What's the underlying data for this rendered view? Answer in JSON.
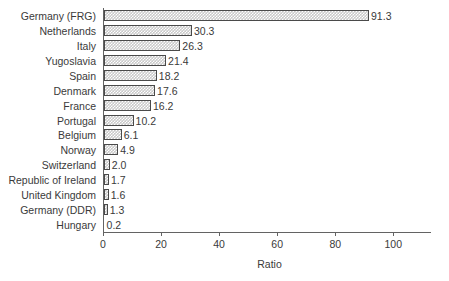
{
  "chart_data": {
    "type": "bar",
    "orientation": "horizontal",
    "title": "",
    "xlabel": "Ratio",
    "ylabel": "",
    "categories": [
      "Germany (FRG)",
      "Netherlands",
      "Italy",
      "Yugoslavia",
      "Spain",
      "Denmark",
      "France",
      "Portugal",
      "Belgium",
      "Norway",
      "Switzerland",
      "Republic of Ireland",
      "United Kingdom",
      "Germany (DDR)",
      "Hungary"
    ],
    "values": [
      91.3,
      30.3,
      26.3,
      21.4,
      18.2,
      17.6,
      16.2,
      10.2,
      6.1,
      4.9,
      2.0,
      1.7,
      1.6,
      1.3,
      0.2
    ],
    "value_labels": [
      "91.3",
      "30.3",
      "26.3",
      "21.4",
      "18.2",
      "17.6",
      "16.2",
      "10.2",
      "6.1",
      "4.9",
      "2.0",
      "1.7",
      "1.6",
      "1.3",
      "0.2"
    ],
    "xticks": [
      0,
      20,
      40,
      60,
      80,
      100
    ],
    "xtick_labels": [
      "0",
      "20",
      "40",
      "60",
      "80",
      "100"
    ],
    "xlim": [
      0,
      113
    ],
    "grid": false,
    "legend": null,
    "bar_fill_color": "#c9c9c9",
    "bar_edge_color": "#4a4a4a",
    "axis_color": "#636363",
    "text_color": "#3a3a3a",
    "background_color": "#ffffff"
  }
}
